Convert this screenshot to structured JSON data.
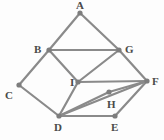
{
  "figure": {
    "name": "undirected-graph-diagram",
    "width": 164,
    "height": 140,
    "background_color": "#fdfdfd",
    "edge_color": "#8a8a8a",
    "vertex_color": "#7d7d7d",
    "label_color": "#4a4a4a",
    "edge_width": 2.2,
    "vertex_radius": 2.6
  },
  "vertices": [
    {
      "id": "A",
      "label": "A",
      "x": 80,
      "y": 13,
      "label_x": 76,
      "label_y": 0
    },
    {
      "id": "B",
      "label": "B",
      "x": 49,
      "y": 50,
      "label_x": 34,
      "label_y": 44
    },
    {
      "id": "G",
      "label": "G",
      "x": 119,
      "y": 50,
      "label_x": 125,
      "label_y": 44
    },
    {
      "id": "C",
      "label": "C",
      "x": 19,
      "y": 85,
      "label_x": 5,
      "label_y": 90
    },
    {
      "id": "I",
      "label": "I",
      "x": 78,
      "y": 82,
      "label_x": 70,
      "label_y": 77
    },
    {
      "id": "F",
      "label": "F",
      "x": 147,
      "y": 81,
      "label_x": 152,
      "label_y": 76
    },
    {
      "id": "H",
      "label": "H",
      "x": 109,
      "y": 92,
      "label_x": 107,
      "label_y": 99
    },
    {
      "id": "D",
      "label": "D",
      "x": 59,
      "y": 116,
      "label_x": 54,
      "label_y": 122
    },
    {
      "id": "E",
      "label": "E",
      "x": 115,
      "y": 116,
      "label_x": 111,
      "label_y": 122
    }
  ],
  "edges": [
    {
      "from": "A",
      "to": "B"
    },
    {
      "from": "A",
      "to": "G"
    },
    {
      "from": "B",
      "to": "G"
    },
    {
      "from": "B",
      "to": "C"
    },
    {
      "from": "B",
      "to": "I"
    },
    {
      "from": "C",
      "to": "D"
    },
    {
      "from": "I",
      "to": "G"
    },
    {
      "from": "I",
      "to": "D"
    },
    {
      "from": "I",
      "to": "F"
    },
    {
      "from": "G",
      "to": "F"
    },
    {
      "from": "D",
      "to": "H"
    },
    {
      "from": "H",
      "to": "F"
    },
    {
      "from": "D",
      "to": "F"
    },
    {
      "from": "D",
      "to": "E"
    },
    {
      "from": "E",
      "to": "F"
    }
  ]
}
